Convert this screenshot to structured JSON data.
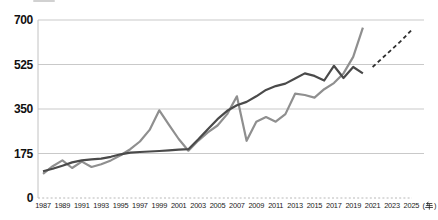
{
  "chart": {
    "y_axis": {
      "tick_labels": [
        "0",
        "175",
        "350",
        "525",
        "700"
      ],
      "tick_values": [
        0,
        175,
        350,
        525,
        700
      ]
    },
    "x_axis": {
      "tick_years": [
        1987,
        1989,
        1991,
        1993,
        1995,
        1997,
        1999,
        2001,
        2003,
        2005,
        2007,
        2009,
        2011,
        2013,
        2015,
        2017,
        2019,
        2021,
        2023,
        2025
      ],
      "unit_full": "(年)",
      "unit_paren_open": "(",
      "unit_kanji": "年",
      "unit_paren_close": ")"
    },
    "colors": {
      "dark_line": "#4a4a4a",
      "gray_line": "#8f8f8f",
      "dashed_line": "#2f2f2f",
      "gridline": "#c9c9c9",
      "baseline": "#b8b8b8",
      "axis_line": "#c2c2c2",
      "text": "#1a1a1a"
    }
  },
  "chart_data": {
    "type": "line",
    "title": "",
    "xlabel_unit": "(年)",
    "xlim": [
      1987,
      2025
    ],
    "ylim": [
      0,
      700
    ],
    "grid": "horizontal",
    "legend": "none",
    "x": [
      1987,
      1988,
      1989,
      1990,
      1991,
      1992,
      1993,
      1994,
      1995,
      1996,
      1997,
      1998,
      1999,
      2000,
      2001,
      2002,
      2003,
      2004,
      2005,
      2006,
      2007,
      2008,
      2009,
      2010,
      2011,
      2012,
      2013,
      2014,
      2015,
      2016,
      2017,
      2018,
      2019,
      2020
    ],
    "series": [
      {
        "name": "dark-solid-line",
        "color": "#4a4a4a",
        "values": [
          105,
          115,
          127,
          140,
          148,
          152,
          155,
          162,
          172,
          178,
          181,
          183,
          185,
          187,
          190,
          192,
          230,
          270,
          310,
          343,
          365,
          378,
          400,
          425,
          440,
          450,
          470,
          490,
          480,
          462,
          520,
          472,
          515,
          490
        ]
      },
      {
        "name": "gray-solid-line",
        "color": "#8f8f8f",
        "values": [
          95,
          125,
          148,
          118,
          143,
          122,
          133,
          148,
          168,
          192,
          222,
          268,
          345,
          288,
          232,
          186,
          225,
          258,
          285,
          330,
          400,
          225,
          300,
          318,
          300,
          330,
          410,
          405,
          395,
          428,
          452,
          490,
          555,
          670
        ]
      }
    ],
    "projection": {
      "name": "dashed-projection-line",
      "color": "#2f2f2f",
      "x": [
        2021,
        2022,
        2023,
        2024,
        2025
      ],
      "values": [
        515,
        550,
        585,
        620,
        660
      ]
    }
  }
}
